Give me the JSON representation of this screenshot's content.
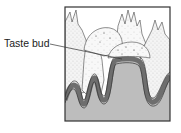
{
  "diagram": {
    "labels": [
      {
        "text": "Taste bud",
        "points_to": "taste-bud"
      }
    ],
    "colors": {
      "background": "#ffffff",
      "frame": "#333333",
      "connective_tissue": "#bdbdbd",
      "epithelium_band": "#6e6e6e",
      "papillae_fill": "#f2f2f2",
      "stipple": "#555555",
      "leader_line": "#333333"
    }
  }
}
